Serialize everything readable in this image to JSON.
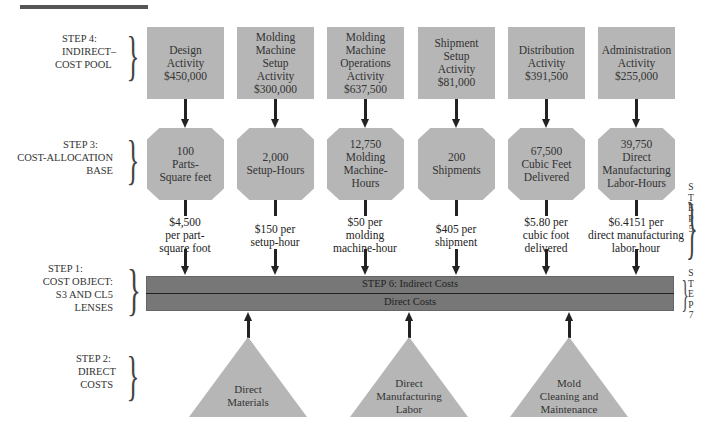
{
  "steps": {
    "step4": {
      "line1": "STEP 4:",
      "line2": "INDIRECT–",
      "line3": "COST POOL"
    },
    "step3": {
      "line1": "STEP 3:",
      "line2": "COST-ALLOCATION",
      "line3": "BASE"
    },
    "step1": {
      "line1": "STEP 1:",
      "line2": "COST OBJECT:",
      "line3": "S3 AND CL5",
      "line4": "LENSES"
    },
    "step2": {
      "line1": "STEP 2:",
      "line2": "DIRECT",
      "line3": "COSTS"
    },
    "step5": [
      "S",
      "T",
      "E",
      "P",
      "5"
    ],
    "step7": [
      "S",
      "T",
      "E",
      "P",
      "7"
    ]
  },
  "pools": [
    {
      "lines": [
        "Design",
        "Activity",
        "$450,000"
      ]
    },
    {
      "lines": [
        "Molding",
        "Machine",
        "Setup",
        "Activity",
        "$300,000"
      ]
    },
    {
      "lines": [
        "Molding",
        "Machine",
        "Operations",
        "Activity",
        "$637,500"
      ]
    },
    {
      "lines": [
        "Shipment",
        "Setup",
        "Activity",
        "$81,000"
      ]
    },
    {
      "lines": [
        "Distribution",
        "Activity",
        "$391,500"
      ]
    },
    {
      "lines": [
        "Administration",
        "Activity",
        "$255,000"
      ]
    }
  ],
  "bases": [
    {
      "lines": [
        "100",
        "Parts-",
        "Square feet"
      ]
    },
    {
      "lines": [
        "2,000",
        "Setup-Hours"
      ]
    },
    {
      "lines": [
        "12,750",
        "Molding",
        "Machine-Hours"
      ]
    },
    {
      "lines": [
        "200",
        "Shipments"
      ]
    },
    {
      "lines": [
        "67,500",
        "Cubic Feet",
        "Delivered"
      ]
    },
    {
      "lines": [
        "39,750",
        "Direct",
        "Manufacturing",
        "Labor-Hours"
      ]
    }
  ],
  "rates": [
    {
      "lines": [
        "$4,500",
        "per part-",
        "square foot"
      ]
    },
    {
      "lines": [
        "$150 per",
        "setup-hour"
      ]
    },
    {
      "lines": [
        "$50 per",
        "molding",
        "machine-hour"
      ]
    },
    {
      "lines": [
        "$405 per",
        "shipment"
      ]
    },
    {
      "lines": [
        "$5.80 per",
        "cubic foot",
        "delivered"
      ]
    },
    {
      "lines": [
        "$6.4151 per",
        "direct manufacturing",
        "labor-hour"
      ]
    }
  ],
  "cost_object_bar": {
    "indirect_label": "STEP 6: Indirect Costs",
    "direct_label": "Direct Costs"
  },
  "direct_costs": [
    {
      "lines": [
        "Direct",
        "Materials"
      ]
    },
    {
      "lines": [
        "Direct",
        "Manufacturing",
        "Labor"
      ]
    },
    {
      "lines": [
        "Mold",
        "Cleaning and",
        "Maintenance"
      ]
    }
  ],
  "colors": {
    "box_fill": "#b6b6b6",
    "bar_fill": "#777777",
    "arrow": "#222222"
  }
}
